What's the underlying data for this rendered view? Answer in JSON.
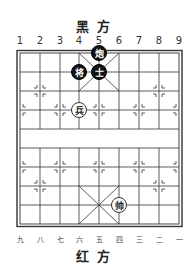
{
  "labels": {
    "top_side": "黑方",
    "bottom_side": "红方"
  },
  "files_top": [
    "1",
    "2",
    "3",
    "4",
    "5",
    "6",
    "7",
    "8",
    "9"
  ],
  "files_bottom": [
    "九",
    "八",
    "七",
    "六",
    "五",
    "四",
    "三",
    "二",
    "一"
  ],
  "pieces": [
    {
      "char": "炮",
      "side": "black",
      "file": 4,
      "rank": 0,
      "name": "black-cannon"
    },
    {
      "char": "将",
      "side": "black",
      "file": 3,
      "rank": 1,
      "name": "black-general"
    },
    {
      "char": "士",
      "side": "black",
      "file": 4,
      "rank": 1,
      "name": "black-advisor"
    },
    {
      "char": "兵",
      "side": "red",
      "file": 3,
      "rank": 3,
      "name": "red-soldier"
    },
    {
      "char": "帅",
      "side": "red",
      "file": 5,
      "rank": 8,
      "name": "red-general"
    }
  ],
  "colors": {
    "board_line": "#333333",
    "black_piece": "#111111",
    "red_piece_fill": "#ffffff"
  }
}
